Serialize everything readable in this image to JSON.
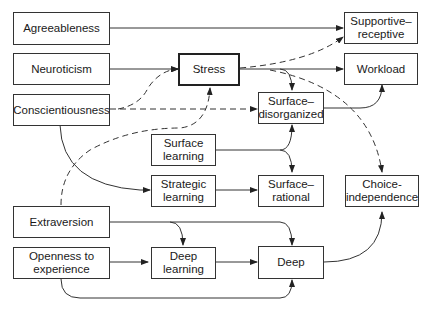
{
  "nodes": {
    "agreeableness": "Agreeableness",
    "neuroticism": "Neuroticism",
    "conscientiousness": "Conscientiousness",
    "stress": "Stress",
    "supportive_receptive": "Supportive–\nreceptive",
    "workload": "Workload",
    "surface_disorganized": "Surface–\ndisorganized",
    "surface_learning": "Surface\nlearning",
    "strategic_learning": "Strategic\nlearning",
    "surface_rational": "Surface–\nrational",
    "choice_independence": "Choice-\nindependence",
    "extraversion": "Extraversion",
    "openness": "Openness to\nexperience",
    "deep_learning": "Deep\nlearning",
    "deep": "Deep"
  },
  "edges": [
    {
      "from": "Agreeableness",
      "to": "Supportive–receptive",
      "style": "solid"
    },
    {
      "from": "Neuroticism",
      "to": "Stress",
      "style": "solid"
    },
    {
      "from": "Conscientiousness",
      "to": "Stress",
      "style": "dashed"
    },
    {
      "from": "Conscientiousness",
      "to": "Surface–disorganized",
      "style": "dashed"
    },
    {
      "from": "Conscientiousness",
      "to": "Strategic learning",
      "style": "solid"
    },
    {
      "from": "Stress",
      "to": "Supportive–receptive",
      "style": "dashed"
    },
    {
      "from": "Stress",
      "to": "Workload",
      "style": "solid"
    },
    {
      "from": "Stress",
      "to": "Surface–disorganized",
      "style": "solid"
    },
    {
      "from": "Stress",
      "to": "Choice-independence",
      "style": "dashed"
    },
    {
      "from": "Surface–disorganized",
      "to": "Workload",
      "style": "solid"
    },
    {
      "from": "Surface learning",
      "to": "Surface–disorganized",
      "style": "solid"
    },
    {
      "from": "Surface learning",
      "to": "Surface–rational",
      "style": "solid"
    },
    {
      "from": "Strategic learning",
      "to": "Surface–rational",
      "style": "solid"
    },
    {
      "from": "Extraversion",
      "to": "Stress",
      "style": "dashed"
    },
    {
      "from": "Extraversion",
      "to": "Deep learning",
      "style": "solid"
    },
    {
      "from": "Extraversion",
      "to": "Deep",
      "style": "solid"
    },
    {
      "from": "Openness to experience",
      "to": "Deep learning",
      "style": "solid"
    },
    {
      "from": "Openness to experience",
      "to": "Deep",
      "style": "solid"
    },
    {
      "from": "Deep learning",
      "to": "Deep",
      "style": "solid"
    },
    {
      "from": "Deep",
      "to": "Choice-independence",
      "style": "solid"
    }
  ]
}
